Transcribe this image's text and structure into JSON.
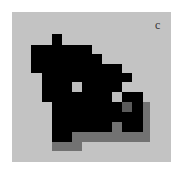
{
  "panel": {
    "label": "c"
  },
  "palette": {
    "background": "#c3c3c3",
    "filled": "#000000",
    "dark_grey": "#5a5a5a",
    "shadow_grey": "#727272",
    "hole": "#bdbdbd"
  },
  "legend_of_states": {
    "0": "background",
    "1": "filled",
    "2": "dark_grey",
    "3": "shadow_grey",
    "4": "hole"
  },
  "grid": [
    [
      0,
      0,
      1,
      0,
      0,
      0,
      0,
      0,
      0,
      0,
      0,
      0
    ],
    [
      1,
      1,
      1,
      1,
      1,
      1,
      0,
      0,
      0,
      0,
      0,
      0
    ],
    [
      1,
      1,
      1,
      1,
      1,
      1,
      1,
      0,
      0,
      0,
      0,
      0
    ],
    [
      1,
      1,
      1,
      1,
      1,
      1,
      1,
      1,
      1,
      0,
      0,
      0
    ],
    [
      0,
      1,
      1,
      1,
      1,
      1,
      1,
      1,
      1,
      1,
      0,
      0
    ],
    [
      0,
      1,
      1,
      1,
      4,
      1,
      1,
      1,
      1,
      0,
      0,
      0
    ],
    [
      0,
      1,
      1,
      1,
      1,
      1,
      1,
      1,
      4,
      1,
      1,
      0
    ],
    [
      0,
      0,
      1,
      1,
      1,
      1,
      1,
      1,
      1,
      2,
      1,
      3
    ],
    [
      0,
      0,
      1,
      1,
      1,
      1,
      1,
      1,
      1,
      1,
      1,
      3
    ],
    [
      0,
      0,
      1,
      1,
      1,
      1,
      1,
      1,
      3,
      1,
      1,
      3
    ],
    [
      0,
      0,
      1,
      1,
      3,
      3,
      3,
      3,
      3,
      3,
      3,
      3
    ],
    [
      0,
      0,
      3,
      3,
      3,
      0,
      0,
      0,
      0,
      0,
      0,
      0
    ]
  ]
}
